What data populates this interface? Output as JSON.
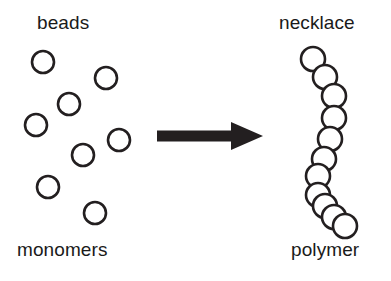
{
  "figure": {
    "background_color": "#ffffff",
    "stroke_color": "#231f20",
    "text_color": "#1a1a1a",
    "width": 391,
    "height": 281
  },
  "labels": {
    "top_left": "beads",
    "bottom_left": "monomers",
    "top_right": "necklace",
    "bottom_right": "polymer"
  },
  "left_panel": {
    "caption_top": "beads",
    "caption_bottom": "monomers",
    "description": "eight separate open circles scattered randomly",
    "bead_count": 8,
    "bead_radius": 11,
    "beads": [
      {
        "cx": 43,
        "cy": 62
      },
      {
        "cx": 106,
        "cy": 78
      },
      {
        "cx": 69,
        "cy": 104
      },
      {
        "cx": 36,
        "cy": 125
      },
      {
        "cx": 119,
        "cy": 140
      },
      {
        "cx": 83,
        "cy": 155
      },
      {
        "cx": 48,
        "cy": 187
      },
      {
        "cx": 95,
        "cy": 213
      }
    ]
  },
  "arrow": {
    "name": "transformation-arrow",
    "direction": "right",
    "x_start": 157,
    "x_end": 263,
    "y_center": 136,
    "shaft_thickness": 11,
    "head_width": 32,
    "head_height": 28
  },
  "right_panel": {
    "caption_top": "necklace",
    "caption_bottom": "polymer",
    "description": "eleven touching circles strung in a curved chain",
    "bead_count": 11,
    "bead_radius": 12,
    "chain": [
      {
        "cx": 313,
        "cy": 59
      },
      {
        "cx": 325,
        "cy": 77
      },
      {
        "cx": 334,
        "cy": 96
      },
      {
        "cx": 334,
        "cy": 118
      },
      {
        "cx": 330,
        "cy": 139
      },
      {
        "cx": 324,
        "cy": 159
      },
      {
        "cx": 318,
        "cy": 176
      },
      {
        "cx": 318,
        "cy": 195
      },
      {
        "cx": 325,
        "cy": 206
      },
      {
        "cx": 334,
        "cy": 217
      },
      {
        "cx": 345,
        "cy": 226
      }
    ]
  }
}
